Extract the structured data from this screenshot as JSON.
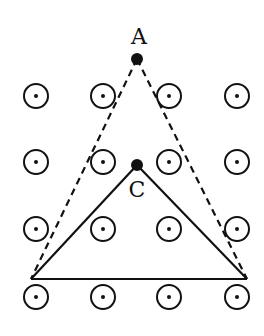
{
  "diagram": {
    "colors": {
      "stroke": "#111111",
      "background": "#ffffff"
    },
    "field_symbol": "field-out-of-page",
    "grid": {
      "columns_x": [
        36,
        103,
        169,
        237
      ],
      "rows_y": [
        96,
        162,
        229,
        297
      ],
      "radius": 12
    },
    "points": {
      "A": {
        "label": "A",
        "x": 137,
        "y": 59,
        "label_x": 139,
        "label_y": 44
      },
      "C": {
        "label": "C",
        "x": 137,
        "y": 165,
        "label_x": 137,
        "label_y": 197
      },
      "left": {
        "x": 31,
        "y": 279
      },
      "right": {
        "x": 247,
        "y": 279
      }
    }
  }
}
